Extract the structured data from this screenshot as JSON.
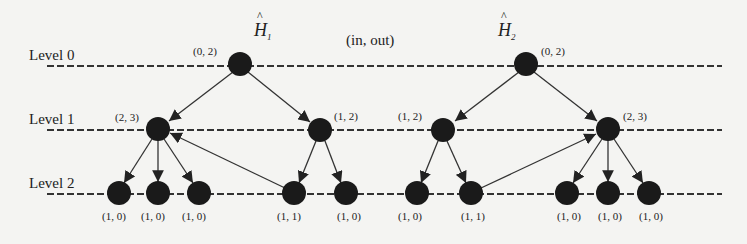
{
  "legend": {
    "label": "(in, out)"
  },
  "levels": [
    {
      "label": "Level 0",
      "y": 66
    },
    {
      "label": "Level 1",
      "y": 130
    },
    {
      "label": "Level 2",
      "y": 194
    }
  ],
  "trees": [
    {
      "name": "H",
      "subscript": "1",
      "hat": "^",
      "nodes": [
        {
          "id": "a0",
          "level": 0,
          "x": 240,
          "label": "(0, 2)"
        },
        {
          "id": "a1",
          "level": 1,
          "x": 158,
          "label": "(2, 3)"
        },
        {
          "id": "a2",
          "level": 1,
          "x": 320,
          "label": "(1, 2)"
        },
        {
          "id": "a3",
          "level": 2,
          "x": 119,
          "label": "(1, 0)"
        },
        {
          "id": "a4",
          "level": 2,
          "x": 158,
          "label": "(1, 0)"
        },
        {
          "id": "a5",
          "level": 2,
          "x": 199,
          "label": "(1, 0)"
        },
        {
          "id": "a6",
          "level": 2,
          "x": 294,
          "label": "(1, 1)"
        },
        {
          "id": "a7",
          "level": 2,
          "x": 346,
          "label": "(1, 0)"
        }
      ]
    },
    {
      "name": "H",
      "subscript": "2",
      "hat": "^",
      "nodes": [
        {
          "id": "b0",
          "level": 0,
          "x": 526,
          "label": "(0, 2)"
        },
        {
          "id": "b1",
          "level": 1,
          "x": 443,
          "label": "(1, 2)"
        },
        {
          "id": "b2",
          "level": 1,
          "x": 608,
          "label": "(2, 3)"
        },
        {
          "id": "b3",
          "level": 2,
          "x": 417,
          "label": "(1, 0)"
        },
        {
          "id": "b4",
          "level": 2,
          "x": 471,
          "label": "(1, 1)"
        },
        {
          "id": "b5",
          "level": 2,
          "x": 567,
          "label": "(1, 0)"
        },
        {
          "id": "b6",
          "level": 2,
          "x": 608,
          "label": "(1, 0)"
        },
        {
          "id": "b7",
          "level": 2,
          "x": 649,
          "label": "(1, 0)"
        }
      ]
    }
  ]
}
